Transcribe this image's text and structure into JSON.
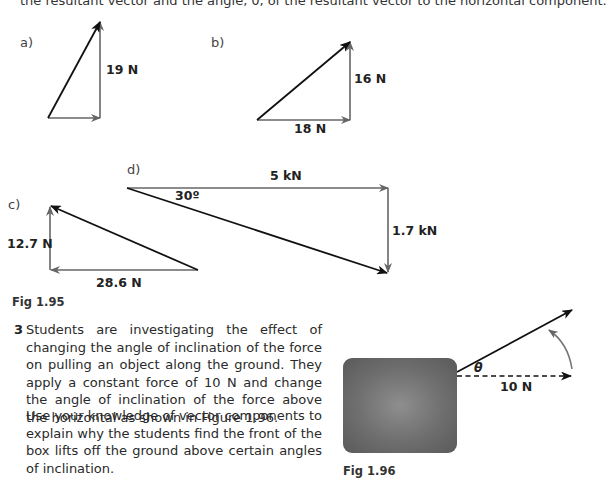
{
  "top_text": "the resultant vector and the angle, θ, of the resultant vector to the horizontal component.",
  "figure_195": {
    "caption": "Fig 1.95",
    "parts": [
      {
        "label": "a)",
        "vertical": "19 N",
        "horizontal": ""
      },
      {
        "label": "b)",
        "vertical": "16 N",
        "horizontal": "18 N"
      },
      {
        "label": "c)",
        "vertical": "12.7 N",
        "horizontal": "28.6 N"
      },
      {
        "label": "d)",
        "vertical": "1.7 kN",
        "horizontal": "5 kN",
        "angle": "30º"
      }
    ]
  },
  "question": {
    "number": "3",
    "paragraph1": "Students are investigating the effect of changing the angle of inclination of the force on pulling an object along the ground. They apply a constant force of 10 N and change the angle of inclination of the force above the horizontal as shown in Figure 1.96.",
    "paragraph2": "Use your knowledge of vector components to explain why the students find the front of the box lifts off the ground above certain angles of inclination."
  },
  "figure_196": {
    "caption": "Fig 1.96",
    "angle_symbol": "θ",
    "force_label": "10 N"
  }
}
